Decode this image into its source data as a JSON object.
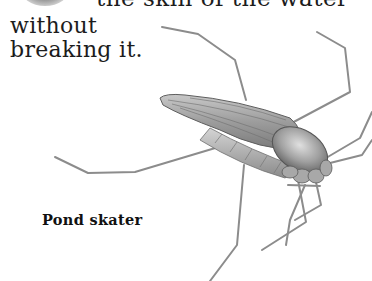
{
  "text": {
    "line_top": "the skin of the water",
    "line_1": "without",
    "line_2": "breaking it."
  },
  "illustration": {
    "subject": "pond-skater-insect",
    "caption": "Pond skater"
  },
  "colors": {
    "background": "#ffffff",
    "text": "#1c1c1c",
    "insect_body": "#9a9a9a",
    "insect_legs": "#8c8c8c"
  }
}
